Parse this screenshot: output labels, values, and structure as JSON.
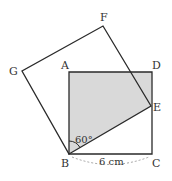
{
  "diagram": {
    "type": "geometry",
    "points": {
      "A": {
        "label": "A",
        "x": 69,
        "y": 72
      },
      "B": {
        "label": "B",
        "x": 69,
        "y": 154
      },
      "C": {
        "label": "C",
        "x": 152,
        "y": 154
      },
      "D": {
        "label": "D",
        "x": 152,
        "y": 72
      },
      "E": {
        "label": "E",
        "x": 151,
        "y": 106
      },
      "F": {
        "label": "F",
        "x": 103,
        "y": 26
      },
      "G": {
        "label": "G",
        "x": 22,
        "y": 71
      }
    },
    "angle_label": "60°",
    "length_label": "6 cm",
    "colors": {
      "stroke": "#2a2a2a",
      "shade": "#d9d9d9",
      "dashed": "#999999"
    }
  }
}
